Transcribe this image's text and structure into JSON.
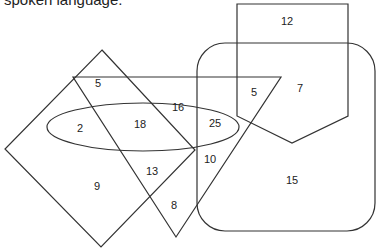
{
  "caption": "spoken language.",
  "diagram": {
    "shapes": [
      "square",
      "triangle",
      "ellipse",
      "rounded-rectangle",
      "pentagon"
    ],
    "regions": [
      {
        "id": "sq-tri-top",
        "value": "5"
      },
      {
        "id": "sq-ellipse",
        "value": "2"
      },
      {
        "id": "sq-tri-ellipse",
        "value": "18"
      },
      {
        "id": "tri-ellipse",
        "value": "16"
      },
      {
        "id": "tri-ellipse-rect",
        "value": "25"
      },
      {
        "id": "tri-rect-pent",
        "value": "5"
      },
      {
        "id": "rect-pent",
        "value": "7"
      },
      {
        "id": "pent-only",
        "value": "12"
      },
      {
        "id": "tri-rect",
        "value": "10"
      },
      {
        "id": "rect-only",
        "value": "15"
      },
      {
        "id": "sq-tri",
        "value": "13"
      },
      {
        "id": "sq-only",
        "value": "9"
      },
      {
        "id": "tri-only",
        "value": "8"
      }
    ]
  }
}
